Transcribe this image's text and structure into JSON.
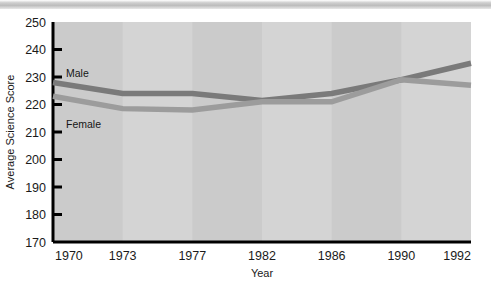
{
  "figure": {
    "top_bar_color": "#bcbcbc",
    "plot_bg_color": "#d4d4d4",
    "band_color": "#cbcbcb",
    "axis_color": "#000000"
  },
  "chart_data": {
    "type": "line",
    "title": "",
    "xlabel": "Year",
    "ylabel": "Average Science Score",
    "categories": [
      "1970",
      "1973",
      "1977",
      "1982",
      "1986",
      "1990",
      "1992"
    ],
    "x_tick_labels": [
      "1970",
      "1973",
      "1977",
      "1982",
      "1986",
      "1990",
      "1992"
    ],
    "y_tick_labels": [
      "250",
      "240",
      "230",
      "220",
      "210",
      "200",
      "190",
      "180",
      "170"
    ],
    "ylim": [
      170,
      250
    ],
    "y_step": 10,
    "grid": false,
    "legend": "inline-labels",
    "series": [
      {
        "name": "Male",
        "color": "#7a7a7a",
        "label_position": "above-left",
        "values": [
          228,
          224,
          224,
          221.5,
          224,
          229,
          235
        ]
      },
      {
        "name": "Female",
        "color": "#9c9c9c",
        "label_position": "below-left",
        "values": [
          223,
          218.5,
          218,
          221,
          221,
          229,
          227
        ]
      }
    ]
  }
}
